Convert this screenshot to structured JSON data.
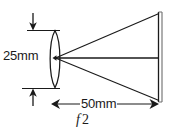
{
  "figure": {
    "type": "optical-ray-diagram",
    "background_color": "#ffffff",
    "line_color": "#1a1a1a",
    "width": 174,
    "height": 133
  },
  "labels": {
    "aperture": "25mm",
    "focal_distance": "50mm",
    "fstop_symbol": "f",
    "fstop_value": "2"
  },
  "elements": {
    "lens_name": "biconvex-lens",
    "film_plane_name": "film-plane",
    "ray_upper_name": "upper-ray",
    "ray_axis_name": "optical-axis-ray",
    "ray_lower_name": "lower-ray",
    "aperture_dimension_name": "aperture-dimension",
    "distance_dimension_name": "focal-distance-dimension"
  },
  "geometry": {
    "lens_center_x": 55,
    "lens_center_y": 58,
    "lens_top_y": 31,
    "lens_bottom_y": 87,
    "lens_half_width": 7,
    "film_plane_x": 160,
    "film_plane_top_y": 13,
    "film_plane_bottom_y": 101,
    "dimension_line_y": 104,
    "dimension_left_x": 52,
    "dimension_right_x": 158,
    "aperture_arrow_x": 33,
    "aperture_extension_left_x": 2,
    "aperture_extension_right_x": 60
  }
}
